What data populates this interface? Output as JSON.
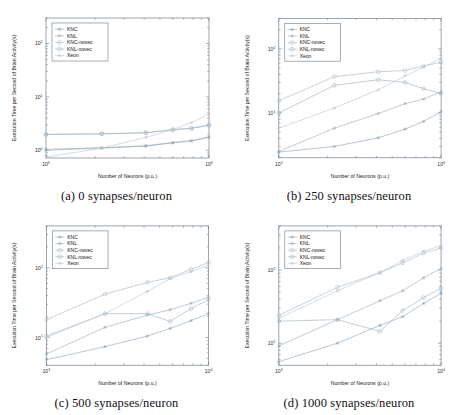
{
  "figure": {
    "axis": {
      "xlabel": "Number of Neurons (p.u.)",
      "ylabel": "Execution Time per Second of Brain Activity(s)",
      "xticks": [
        "10^3",
        "10^4"
      ],
      "xtick_base": [
        "10",
        "10"
      ],
      "xtick_exp": [
        "3",
        "4"
      ],
      "ytick_base": [
        "10",
        "10",
        "10"
      ],
      "ytick_exp": [
        "0",
        "1",
        "2"
      ]
    },
    "legend": {
      "items": [
        {
          "label": "KNC",
          "color": "#8fa3b5",
          "marker": "asterisk"
        },
        {
          "label": "KNL",
          "color": "#9aaab8",
          "marker": "asterisk"
        },
        {
          "label": "KNC-novec",
          "color": "#a7b6c2",
          "marker": "circle"
        },
        {
          "label": "KNL-novec",
          "color": "#9fb0bd",
          "marker": "circle"
        },
        {
          "label": "Xeon",
          "color": "#b9c6d1",
          "marker": "asterisk"
        }
      ]
    },
    "panels": [
      {
        "id": "a",
        "caption": "(a) 0 synapses/neuron"
      },
      {
        "id": "b",
        "caption": "(b) 250 synapses/neuron"
      },
      {
        "id": "c",
        "caption": "(c) 500 synapses/neuron"
      },
      {
        "id": "d",
        "caption": "(d) 1000 synapses/neuron"
      }
    ]
  },
  "chart_data": [
    {
      "type": "line",
      "panel": "a",
      "title": "(a) 0 synapses/neuron",
      "xlabel": "Number of Neurons (p.u.)",
      "ylabel": "Execution Time per Second of Brain Activity(s)",
      "xscale": "log",
      "yscale": "log",
      "xlim": [
        1000,
        10000
      ],
      "ylim": [
        0.72,
        300
      ],
      "x": [
        1000,
        2200,
        4100,
        6000,
        7800,
        10000
      ],
      "series": [
        {
          "name": "KNC",
          "values": [
            1.05,
            1.12,
            1.22,
            1.4,
            1.52,
            1.78
          ]
        },
        {
          "name": "KNL",
          "values": [
            1.0,
            1.1,
            1.2,
            1.38,
            1.5,
            1.75
          ]
        },
        {
          "name": "KNC-novec",
          "values": [
            2.0,
            2.05,
            2.15,
            2.45,
            2.6,
            3.0
          ]
        },
        {
          "name": "KNL-novec",
          "values": [
            1.98,
            2.03,
            2.13,
            2.42,
            2.58,
            2.95
          ]
        },
        {
          "name": "Xeon",
          "values": [
            0.75,
            1.1,
            1.75,
            2.45,
            3.3,
            4.8
          ]
        }
      ]
    },
    {
      "type": "line",
      "panel": "b",
      "title": "(b) 250 synapses/neuron",
      "xlabel": "Number of Neurons (p.u.)",
      "ylabel": "Execution Time per Second of Brain Activity(s)",
      "xscale": "log",
      "yscale": "log",
      "xlim": [
        1000,
        10000
      ],
      "ylim": [
        2.0,
        300
      ],
      "x": [
        1000,
        2200,
        4100,
        6000,
        7800,
        10000
      ],
      "series": [
        {
          "name": "KNC",
          "values": [
            2.45,
            3.0,
            4.1,
            5.6,
            7.4,
            10.5
          ]
        },
        {
          "name": "KNL",
          "values": [
            2.5,
            5.8,
            9.8,
            14.0,
            16.5,
            21.5
          ]
        },
        {
          "name": "KNC-novec",
          "values": [
            15.5,
            37.0,
            44.0,
            46.0,
            54.0,
            62.0
          ]
        },
        {
          "name": "KNL-novec",
          "values": [
            10.0,
            27.0,
            33.0,
            30.0,
            24.0,
            20.0
          ]
        },
        {
          "name": "Xeon",
          "values": [
            5.8,
            12.0,
            23.0,
            38.0,
            52.0,
            72.0
          ]
        }
      ]
    },
    {
      "type": "line",
      "panel": "c",
      "title": "(c) 500 synapses/neuron",
      "xlabel": "Number of Neurons (p.u.)",
      "ylabel": "Execution Time per Second of Brain Activity(s)",
      "xscale": "log",
      "yscale": "log",
      "xlim": [
        1000,
        10000
      ],
      "ylim": [
        4.0,
        400
      ],
      "x": [
        1000,
        2300,
        4200,
        5800,
        7800,
        10000
      ],
      "series": [
        {
          "name": "KNC",
          "values": [
            4.8,
            7.4,
            10.5,
            13.5,
            17.5,
            22.0
          ]
        },
        {
          "name": "KNL",
          "values": [
            5.8,
            14.0,
            21.0,
            25.0,
            31.0,
            38.0
          ]
        },
        {
          "name": "KNC-novec",
          "values": [
            18.0,
            42.0,
            62.0,
            72.0,
            95.0,
            120.0
          ]
        },
        {
          "name": "KNL-novec",
          "values": [
            10.5,
            22.0,
            22.0,
            17.0,
            26.0,
            35.0
          ]
        },
        {
          "name": "Xeon",
          "values": [
            10.0,
            22.0,
            46.0,
            70.0,
            88.0,
            110.0
          ]
        }
      ]
    },
    {
      "type": "line",
      "panel": "d",
      "title": "(d) 1000 synapses/neuron",
      "xlabel": "Number of Neurons (p.u.)",
      "ylabel": "Execution Time per Second of Brain Activity(s)",
      "xscale": "log",
      "yscale": "log",
      "xlim": [
        1000,
        10000
      ],
      "ylim": [
        5.0,
        400
      ],
      "x": [
        1000,
        2300,
        4200,
        5800,
        7800,
        10000
      ],
      "series": [
        {
          "name": "KNC",
          "values": [
            5.6,
            10.0,
            17.5,
            23.0,
            35.0,
            48.0
          ]
        },
        {
          "name": "KNL",
          "values": [
            9.2,
            21.0,
            38.0,
            52.0,
            78.0,
            105.0
          ]
        },
        {
          "name": "KNC-novec",
          "values": [
            24.0,
            58.0,
            92.0,
            125.0,
            170.0,
            200.0
          ]
        },
        {
          "name": "KNL-novec",
          "values": [
            20.0,
            21.0,
            14.5,
            28.0,
            42.0,
            56.0
          ]
        },
        {
          "name": "Xeon",
          "values": [
            22.0,
            52.0,
            92.0,
            135.0,
            180.0,
            215.0
          ]
        }
      ]
    }
  ]
}
